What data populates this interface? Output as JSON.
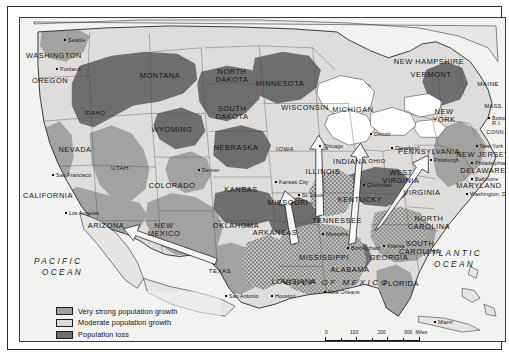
{
  "map": {
    "title": "United States population growth and African-American migration",
    "oceans": [
      {
        "name": "pacific",
        "line1": "PACIFIC",
        "line2": "OCEAN"
      },
      {
        "name": "atlantic",
        "line1": "ATLANTIC",
        "line2": "OCEAN"
      }
    ],
    "gulf_label": "GULF OF MEXICO",
    "states": [
      {
        "label": "WASHINGTON",
        "x": 34,
        "y": 38
      },
      {
        "label": "OREGON",
        "x": 30,
        "y": 63
      },
      {
        "label": "IDAHO",
        "x": 75,
        "y": 95
      },
      {
        "label": "MONTANA",
        "x": 140,
        "y": 58
      },
      {
        "label": "NORTH\nDAKOTA",
        "x": 212,
        "y": 58
      },
      {
        "label": "SOUTH\nDAKOTA",
        "x": 212,
        "y": 95
      },
      {
        "label": "WYOMING",
        "x": 152,
        "y": 112
      },
      {
        "label": "NEVADA",
        "x": 55,
        "y": 132
      },
      {
        "label": "UTAH",
        "x": 100,
        "y": 150
      },
      {
        "label": "COLORADO",
        "x": 152,
        "y": 168
      },
      {
        "label": "NEBRASKA",
        "x": 216,
        "y": 130
      },
      {
        "label": "KANSAS",
        "x": 221,
        "y": 172
      },
      {
        "label": "MINNESOTA",
        "x": 260,
        "y": 66
      },
      {
        "label": "WISCONSIN",
        "x": 285,
        "y": 90
      },
      {
        "label": "IOWA",
        "x": 265,
        "y": 131
      },
      {
        "label": "ILLINOIS",
        "x": 303,
        "y": 154
      },
      {
        "label": "MISSOURI",
        "x": 268,
        "y": 185
      },
      {
        "label": "CALIFORNIA",
        "x": 28,
        "y": 178
      },
      {
        "label": "ARIZONA",
        "x": 86,
        "y": 208
      },
      {
        "label": "NEW\nMEXICO",
        "x": 144,
        "y": 212
      },
      {
        "label": "OKLAHOMA",
        "x": 216,
        "y": 208
      },
      {
        "label": "TEXAS",
        "x": 200,
        "y": 253
      },
      {
        "label": "ARKANSAS",
        "x": 255,
        "y": 215
      },
      {
        "label": "LOUISIANA",
        "x": 274,
        "y": 264
      },
      {
        "label": "MISSISSIPPI",
        "x": 304,
        "y": 240
      },
      {
        "label": "ALABAMA",
        "x": 330,
        "y": 252
      },
      {
        "label": "TENNESSEE",
        "x": 317,
        "y": 203
      },
      {
        "label": "KENTUCKY",
        "x": 340,
        "y": 182
      },
      {
        "label": "INDIANA",
        "x": 330,
        "y": 144
      },
      {
        "label": "OHIO",
        "x": 357,
        "y": 143
      },
      {
        "label": "MICHIGAN",
        "x": 333,
        "y": 92
      },
      {
        "label": "WEST\nVIRGINIA",
        "x": 381,
        "y": 159
      },
      {
        "label": "VIRGINIA",
        "x": 402,
        "y": 175
      },
      {
        "label": "NORTH\nCAROLINA",
        "x": 409,
        "y": 205
      },
      {
        "label": "SOUTH\nCAROLINA",
        "x": 400,
        "y": 230
      },
      {
        "label": "GEORGIA",
        "x": 369,
        "y": 240
      },
      {
        "label": "FLORIDA",
        "x": 381,
        "y": 266
      },
      {
        "label": "PENNSYLVANIA",
        "x": 409,
        "y": 134
      },
      {
        "label": "NEW\nYORK",
        "x": 424,
        "y": 98
      },
      {
        "label": "MAINE",
        "x": 468,
        "y": 66
      },
      {
        "label": "NEW HAMPSHIRE",
        "x": 409,
        "y": 44
      },
      {
        "label": "VERMONT",
        "x": 411,
        "y": 57
      },
      {
        "label": "MASS.",
        "x": 474,
        "y": 88
      },
      {
        "label": "R.I.",
        "x": 477,
        "y": 105
      },
      {
        "label": "CONN.",
        "x": 476,
        "y": 114
      },
      {
        "label": "NEW JERSEY",
        "x": 463,
        "y": 137
      },
      {
        "label": "DELAWARE",
        "x": 463,
        "y": 153
      },
      {
        "label": "MARYLAND",
        "x": 459,
        "y": 168
      }
    ],
    "cities": [
      {
        "label": "Seattle",
        "x": 45,
        "y": 22
      },
      {
        "label": "Portland",
        "x": 37,
        "y": 51
      },
      {
        "label": "San Francisco",
        "x": 33,
        "y": 157
      },
      {
        "label": "Los Angeles",
        "x": 46,
        "y": 195
      },
      {
        "label": "Denver",
        "x": 179,
        "y": 152
      },
      {
        "label": "Kansas City",
        "x": 256,
        "y": 164
      },
      {
        "label": "St. Louis",
        "x": 279,
        "y": 177
      },
      {
        "label": "Chicago",
        "x": 300,
        "y": 128
      },
      {
        "label": "Detroit",
        "x": 351,
        "y": 116
      },
      {
        "label": "Cleveland",
        "x": 372,
        "y": 130
      },
      {
        "label": "Cincinnati",
        "x": 344,
        "y": 167
      },
      {
        "label": "Memphis",
        "x": 303,
        "y": 216
      },
      {
        "label": "Birmingham",
        "x": 328,
        "y": 230
      },
      {
        "label": "Atlanta",
        "x": 364,
        "y": 228
      },
      {
        "label": "New Orleans",
        "x": 305,
        "y": 274
      },
      {
        "label": "Houston",
        "x": 252,
        "y": 278
      },
      {
        "label": "San Antonio",
        "x": 206,
        "y": 278
      },
      {
        "label": "Miami",
        "x": 415,
        "y": 304
      },
      {
        "label": "New York",
        "x": 457,
        "y": 128
      },
      {
        "label": "Boston",
        "x": 469,
        "y": 100
      },
      {
        "label": "Philadelphia",
        "x": 452,
        "y": 145
      },
      {
        "label": "Baltimore",
        "x": 452,
        "y": 161
      },
      {
        "label": "Washington, D.C.",
        "x": 447,
        "y": 176
      },
      {
        "label": "Pittsburgh",
        "x": 411,
        "y": 142
      }
    ]
  },
  "legend": {
    "items": [
      {
        "label": "Very strong population growth",
        "swatch": "very-strong-growth",
        "color": "#a0a0a0"
      },
      {
        "label": "Moderate population growth",
        "swatch": "moderate-growth",
        "color": "#d9d9d7"
      },
      {
        "label": "Population loss",
        "swatch": "population-loss",
        "color": "#6e6e6e"
      },
      {
        "label": "African-American migration",
        "swatch": "migration-hatch",
        "color": "#cfcfcf"
      }
    ]
  },
  "scale": {
    "miles": {
      "ticks": [
        "0",
        "100",
        "200",
        "300"
      ],
      "unit": "Miles"
    },
    "kilometers": {
      "ticks": [
        "0",
        "100",
        "200",
        "300"
      ],
      "unit": "Kilometers"
    }
  }
}
